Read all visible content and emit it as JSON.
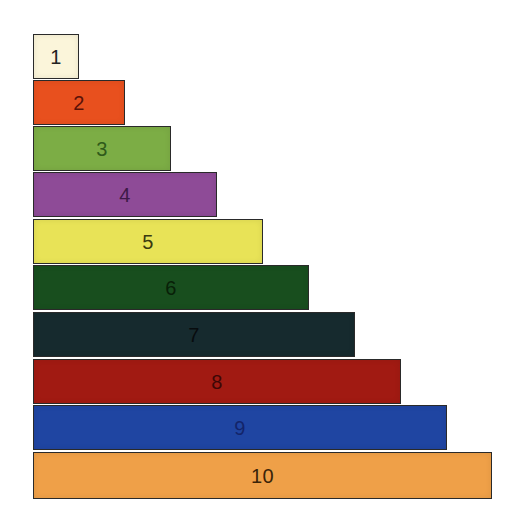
{
  "diagram": {
    "type": "staircase",
    "unit_width_px": 46,
    "rods": [
      {
        "label": "1",
        "value": 1,
        "fill": "#FBF5DA",
        "text": "#222222"
      },
      {
        "label": "2",
        "value": 2,
        "fill": "#E8501E",
        "text": "#5A1208"
      },
      {
        "label": "3",
        "value": 3,
        "fill": "#7CAD45",
        "text": "#2F5A1A"
      },
      {
        "label": "4",
        "value": 4,
        "fill": "#8E4B97",
        "text": "#3E1A48"
      },
      {
        "label": "5",
        "value": 5,
        "fill": "#E8E357",
        "text": "#3A3A10"
      },
      {
        "label": "6",
        "value": 6,
        "fill": "#184E1E",
        "text": "#082008"
      },
      {
        "label": "7",
        "value": 7,
        "fill": "#162A2E",
        "text": "#080C0E"
      },
      {
        "label": "8",
        "value": 8,
        "fill": "#A11A12",
        "text": "#3E0706"
      },
      {
        "label": "9",
        "value": 9,
        "fill": "#1F45A2",
        "text": "#13246A"
      },
      {
        "label": "10",
        "value": 10,
        "fill": "#EFA048",
        "text": "#3A2408"
      }
    ]
  }
}
